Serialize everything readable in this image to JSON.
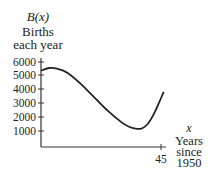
{
  "chart_data": {
    "type": "line",
    "title": "",
    "function_label": "B(x)",
    "ylabel": "Births each year",
    "ylabel_lines": [
      "Births",
      "each year"
    ],
    "xlabel_var": "x",
    "xlabel_lines": [
      "Years",
      "since",
      "1950"
    ],
    "xlabel": "Years since 1950",
    "y_ticks": [
      1000,
      2000,
      3000,
      4000,
      5000,
      6000
    ],
    "y_tick_labels": [
      "1000",
      "2000",
      "3000",
      "4000",
      "5000",
      "6000"
    ],
    "x_ticks": [
      45
    ],
    "x_tick_labels": [
      "45"
    ],
    "xlim": [
      0,
      50
    ],
    "ylim": [
      0,
      6000
    ],
    "grid": false,
    "legend": "none",
    "series": [
      {
        "name": "B(x)",
        "x": [
          0,
          3,
          6,
          10,
          15,
          20,
          25,
          30,
          33,
          36,
          38,
          40,
          42,
          44,
          46
        ],
        "values": [
          5300,
          5500,
          5450,
          5150,
          4350,
          3400,
          2450,
          1650,
          1300,
          1150,
          1200,
          1500,
          2100,
          2900,
          3800
        ]
      }
    ]
  }
}
